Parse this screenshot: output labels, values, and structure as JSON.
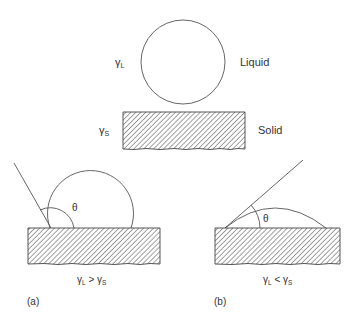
{
  "figure": {
    "top": {
      "gamma_liquid": "γ",
      "gamma_liquid_sub": "L",
      "gamma_solid": "γ",
      "gamma_solid_sub": "S",
      "liquid_label": "Liquid",
      "solid_label": "Solid"
    },
    "panel_a": {
      "theta": "θ",
      "relation_gamma1": "γ",
      "relation_sub1": "L",
      "relation_op": " > ",
      "relation_gamma2": "γ",
      "relation_sub2": "S",
      "caption": "(a)"
    },
    "panel_b": {
      "theta": "θ",
      "relation_gamma1": "γ",
      "relation_sub1": "L",
      "relation_op": " < ",
      "relation_gamma2": "γ",
      "relation_sub2": "S",
      "caption": "(b)"
    },
    "colors": {
      "line": "#555555",
      "text": "#333333",
      "hatch": "#444444"
    }
  }
}
